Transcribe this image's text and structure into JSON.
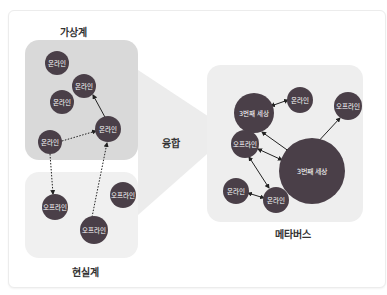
{
  "colors": {
    "node": "#4a3f48",
    "virtual_bg": "#d9d9d9",
    "real_bg": "#f0f0f0",
    "metaverse_bg": "#eeeeee",
    "chevron": "#ececec"
  },
  "labels": {
    "virtual": "가상계",
    "real": "현실계",
    "fusion": "융합",
    "metaverse": "메타버스"
  },
  "left_nodes": [
    {
      "text": "온라인",
      "x": 57,
      "y": 63,
      "r": 12
    },
    {
      "text": "온라인",
      "x": 84,
      "y": 86,
      "r": 12
    },
    {
      "text": "온라인",
      "x": 62,
      "y": 102,
      "r": 12
    },
    {
      "text": "온라인",
      "x": 50,
      "y": 142,
      "r": 12
    },
    {
      "text": "온라인",
      "x": 108,
      "y": 129,
      "r": 13
    },
    {
      "text": "오프라인",
      "x": 55,
      "y": 207,
      "r": 13
    },
    {
      "text": "오프라인",
      "x": 123,
      "y": 195,
      "r": 13
    },
    {
      "text": "오프라인",
      "x": 94,
      "y": 230,
      "r": 14
    }
  ],
  "right_nodes": [
    {
      "text": "3번째 세상",
      "x": 254,
      "y": 113,
      "r": 20
    },
    {
      "text": "온라인",
      "x": 300,
      "y": 100,
      "r": 13
    },
    {
      "text": "오프라인",
      "x": 348,
      "y": 106,
      "r": 14
    },
    {
      "text": "오프라인",
      "x": 245,
      "y": 144,
      "r": 14
    },
    {
      "text": "3번째 세상",
      "x": 312,
      "y": 171,
      "r": 33
    },
    {
      "text": "온라인",
      "x": 236,
      "y": 191,
      "r": 13
    },
    {
      "text": "온라인",
      "x": 276,
      "y": 200,
      "r": 13
    }
  ]
}
